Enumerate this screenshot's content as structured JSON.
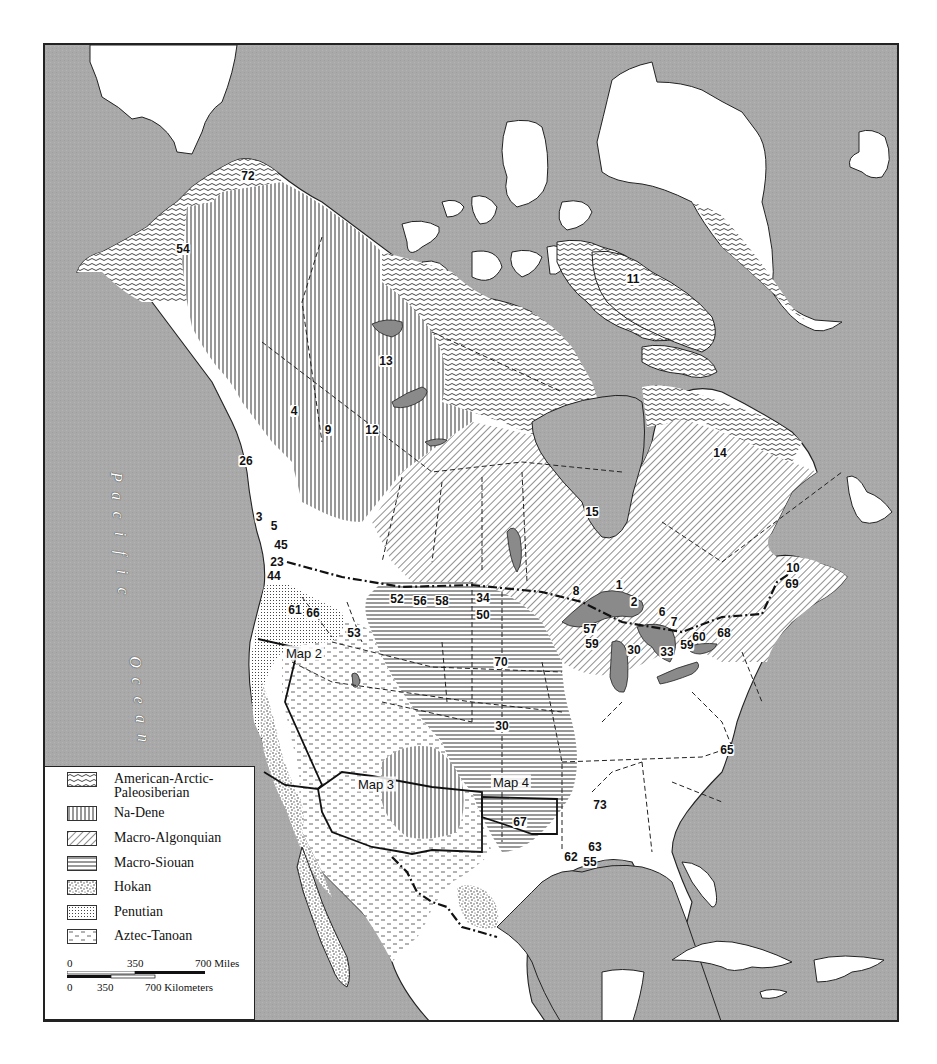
{
  "map": {
    "title": "Native North American Language Phyla",
    "ocean_label": {
      "word1": [
        "P",
        "a",
        "c",
        "i",
        "f",
        "i",
        "c"
      ],
      "word2": [
        "O",
        "c",
        "e",
        "a",
        "n"
      ]
    },
    "inset_labels": [
      {
        "id": "map2",
        "text": "Map 2",
        "x": 302,
        "y": 651
      },
      {
        "id": "map3",
        "text": "Map 3",
        "x": 374,
        "y": 782
      },
      {
        "id": "map4",
        "text": "Map 4",
        "x": 509,
        "y": 780
      }
    ],
    "region_numbers": [
      {
        "n": "72",
        "x": 246,
        "y": 174
      },
      {
        "n": "54",
        "x": 181,
        "y": 247
      },
      {
        "n": "11",
        "x": 631,
        "y": 277
      },
      {
        "n": "13",
        "x": 384,
        "y": 359
      },
      {
        "n": "4",
        "x": 292,
        "y": 409
      },
      {
        "n": "9",
        "x": 326,
        "y": 428
      },
      {
        "n": "12",
        "x": 370,
        "y": 428
      },
      {
        "n": "26",
        "x": 244,
        "y": 459
      },
      {
        "n": "14",
        "x": 718,
        "y": 451
      },
      {
        "n": "15",
        "x": 590,
        "y": 510
      },
      {
        "n": "3",
        "x": 257,
        "y": 515
      },
      {
        "n": "5",
        "x": 272,
        "y": 524
      },
      {
        "n": "45",
        "x": 279,
        "y": 543
      },
      {
        "n": "23",
        "x": 275,
        "y": 560
      },
      {
        "n": "44",
        "x": 272,
        "y": 574
      },
      {
        "n": "8",
        "x": 574,
        "y": 589
      },
      {
        "n": "1",
        "x": 617,
        "y": 583
      },
      {
        "n": "2",
        "x": 632,
        "y": 600
      },
      {
        "n": "10",
        "x": 791,
        "y": 566
      },
      {
        "n": "69",
        "x": 790,
        "y": 582
      },
      {
        "n": "52",
        "x": 395,
        "y": 597
      },
      {
        "n": "56",
        "x": 418,
        "y": 599
      },
      {
        "n": "58",
        "x": 440,
        "y": 599
      },
      {
        "n": "34",
        "x": 481,
        "y": 596
      },
      {
        "n": "50",
        "x": 481,
        "y": 613
      },
      {
        "n": "61",
        "x": 293,
        "y": 608
      },
      {
        "n": "66",
        "x": 311,
        "y": 611
      },
      {
        "n": "6",
        "x": 660,
        "y": 610
      },
      {
        "n": "7",
        "x": 672,
        "y": 620
      },
      {
        "n": "57",
        "x": 588,
        "y": 627
      },
      {
        "n": "59",
        "x": 590,
        "y": 642
      },
      {
        "n": "53",
        "x": 352,
        "y": 631
      },
      {
        "n": "30",
        "x": 632,
        "y": 648
      },
      {
        "n": "33",
        "x": 665,
        "y": 650
      },
      {
        "n": "59",
        "x": 685,
        "y": 643
      },
      {
        "n": "60",
        "x": 697,
        "y": 635
      },
      {
        "n": "68",
        "x": 722,
        "y": 631
      },
      {
        "n": "70",
        "x": 499,
        "y": 660
      },
      {
        "n": "30",
        "x": 500,
        "y": 724
      },
      {
        "n": "65",
        "x": 725,
        "y": 748
      },
      {
        "n": "73",
        "x": 598,
        "y": 803
      },
      {
        "n": "67",
        "x": 518,
        "y": 820
      },
      {
        "n": "63",
        "x": 593,
        "y": 845
      },
      {
        "n": "62",
        "x": 569,
        "y": 855
      },
      {
        "n": "55",
        "x": 588,
        "y": 860
      }
    ]
  },
  "legend": {
    "items": [
      {
        "id": "american-arctic",
        "label_line1": "American-Arctic-",
        "label_line2": "Paleosiberian",
        "pattern": "waves"
      },
      {
        "id": "na-dene",
        "label_line1": "Na-Dene",
        "label_line2": "",
        "pattern": "vertical"
      },
      {
        "id": "macro-algonquian",
        "label_line1": "Macro-Algonquian",
        "label_line2": "",
        "pattern": "diagonal"
      },
      {
        "id": "macro-siouan",
        "label_line1": "Macro-Siouan",
        "label_line2": "",
        "pattern": "horizontal"
      },
      {
        "id": "hokan",
        "label_line1": "Hokan",
        "label_line2": "",
        "pattern": "stipple"
      },
      {
        "id": "penutian",
        "label_line1": "Penutian",
        "label_line2": "",
        "pattern": "dots"
      },
      {
        "id": "aztec-tanoan",
        "label_line1": "Aztec-Tanoan",
        "label_line2": "",
        "pattern": "dashes"
      }
    ],
    "scale": {
      "miles": [
        "0",
        "350",
        "700 Miles"
      ],
      "kilometers": [
        "0",
        "350",
        "700 Kilometers"
      ]
    }
  },
  "colors": {
    "ocean": "#a9a9a9",
    "land": "#ffffff",
    "lakes": "#8a8a8a",
    "lines": "#222222"
  }
}
